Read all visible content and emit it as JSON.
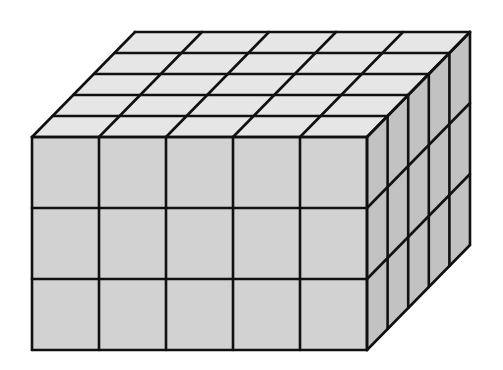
{
  "diagram": {
    "title": "Rectangular prism built from unit cubes",
    "type": "isometric-cube-stack",
    "dimensions": {
      "width_cubes": 5,
      "height_cubes": 3,
      "depth_cubes": 5
    },
    "total_cubes": 75,
    "colors": {
      "background": "#ffffff",
      "top_face": "#e6e6e6",
      "front_face": "#d2d2d2",
      "side_face": "#c2c2c2",
      "edge": "#111111"
    },
    "geometry": {
      "front_left": 32,
      "front_top": 137,
      "cell_width": 67,
      "cell_height": 71,
      "depth_dx": 20.6,
      "depth_dy": -21
    }
  }
}
